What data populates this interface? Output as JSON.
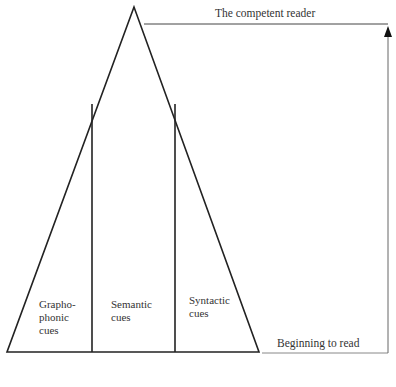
{
  "diagram": {
    "top_label": "The competent reader",
    "bottom_label": "Beginning to read",
    "sections": [
      {
        "label_lines": [
          "Grapho-",
          "phonic",
          "cues"
        ]
      },
      {
        "label_lines": [
          "Semantic",
          "cues"
        ]
      },
      {
        "label_lines": [
          "Syntactic",
          "cues"
        ]
      }
    ]
  }
}
